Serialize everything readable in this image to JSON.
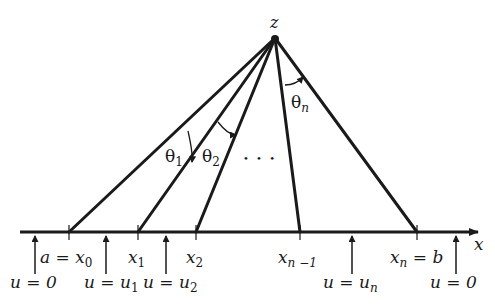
{
  "diagram": {
    "apex": {
      "label": "z",
      "x": 275,
      "y": 38
    },
    "axis": {
      "label": "x",
      "y": 232,
      "x_start": 20,
      "x_end": 480
    },
    "rays": [
      {
        "name": "ray-x0",
        "foot_x": 69
      },
      {
        "name": "ray-x1",
        "foot_x": 138
      },
      {
        "name": "ray-x2",
        "foot_x": 196
      },
      {
        "name": "ray-xn-1",
        "foot_x": 300
      },
      {
        "name": "ray-xn",
        "foot_x": 417
      }
    ],
    "points": [
      {
        "base": "a = x",
        "sub": "0",
        "x": 36
      },
      {
        "base": "x",
        "sub": "1",
        "x": 130
      },
      {
        "base": "x",
        "sub": "2",
        "x": 187
      },
      {
        "base": "x",
        "sub": "n −1",
        "x": 280
      },
      {
        "base": "x",
        "sub": "n",
        "tail": " = b",
        "x": 390
      }
    ],
    "arrows": [
      {
        "x": 35,
        "label_base": "u = 0",
        "label_sub": ""
      },
      {
        "x": 106,
        "label_base": "u = u",
        "label_sub": "1"
      },
      {
        "x": 166,
        "label_base": "u = u",
        "label_sub": "2"
      },
      {
        "x": 352,
        "label_base": "u = u",
        "label_sub": "n"
      },
      {
        "x": 456,
        "label_base": "u = 0",
        "label_sub": ""
      }
    ],
    "angles": [
      {
        "symbol": "θ",
        "sub": "1"
      },
      {
        "symbol": "θ",
        "sub": "2"
      },
      {
        "symbol": "θ",
        "sub": "n"
      }
    ],
    "ellipsis": "• • •",
    "line_color": "#1a1a1a"
  }
}
